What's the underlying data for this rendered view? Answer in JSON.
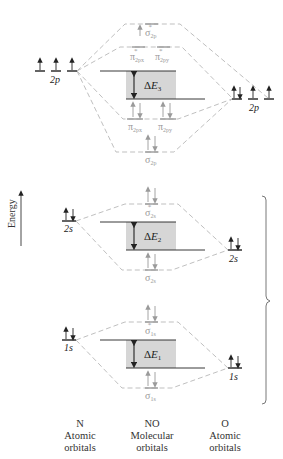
{
  "colors": {
    "line": "#222222",
    "faded": "#9a9a9a",
    "dash": "#b5b5b5",
    "gap_fill": "#d6d6d6"
  },
  "axis": {
    "label": "Energy",
    "direction": "up"
  },
  "columns": [
    {
      "id": "N",
      "line1": "N",
      "line2": "Atomic",
      "line3": "orbitals"
    },
    {
      "id": "NO",
      "line1": "NO",
      "line2": "Molecular",
      "line3": "orbitals"
    },
    {
      "id": "O",
      "line1": "O",
      "line2": "Atomic",
      "line3": "orbitals"
    }
  ],
  "atomic_orbitals": {
    "N_2p": {
      "label": "2p",
      "electrons": [
        "↑",
        "↑",
        "↑"
      ]
    },
    "O_2p": {
      "label": "2p",
      "electrons": [
        "↑↓",
        "↑",
        "↑"
      ]
    },
    "N_2s": {
      "label": "2s",
      "electrons": [
        "↑↓"
      ]
    },
    "O_2s": {
      "label": "2s",
      "electrons": [
        "↑↓"
      ]
    },
    "N_1s": {
      "label": "1s",
      "electrons": [
        "↑↓"
      ]
    },
    "O_1s": {
      "label": "1s",
      "electrons": [
        "↑↓"
      ]
    }
  },
  "molecular_orbitals": {
    "sigma_star_2p": {
      "label": "σ*2p",
      "sym": "σ",
      "sub": "2p",
      "star": "*",
      "electrons": "↑"
    },
    "pi_star_2px": {
      "label": "π*2px",
      "sym": "π",
      "sub": "2px",
      "star": "*",
      "electrons": ""
    },
    "pi_star_2py": {
      "label": "π*2py",
      "sym": "π",
      "sub": "2py",
      "star": "*",
      "electrons": ""
    },
    "pi_2px": {
      "label": "π2px",
      "sym": "π",
      "sub": "2px",
      "electrons": "↑↓"
    },
    "pi_2py": {
      "label": "π2py",
      "sym": "π",
      "sub": "2py",
      "electrons": "↑↓"
    },
    "sigma_2p": {
      "label": "σ2p",
      "sym": "σ",
      "sub": "2p",
      "electrons": "↑↓"
    },
    "sigma_star_2s": {
      "label": "σ*2s",
      "sym": "σ",
      "sub": "2s",
      "star": "*",
      "electrons": "↑↓"
    },
    "sigma_2s": {
      "label": "σ2s",
      "sym": "σ",
      "sub": "2s",
      "electrons": "↑↓"
    },
    "sigma_star_1s": {
      "label": "σ*1s",
      "sym": "σ",
      "sub": "1s",
      "star": "*",
      "electrons": "↑↓"
    },
    "sigma_1s": {
      "label": "σ1s",
      "sym": "σ",
      "sub": "1s",
      "electrons": "↑↓"
    }
  },
  "energy_gaps": [
    {
      "id": "dE3",
      "delta": "Δ",
      "E": "E",
      "sub": "3"
    },
    {
      "id": "dE2",
      "delta": "Δ",
      "E": "E",
      "sub": "2"
    },
    {
      "id": "dE1",
      "delta": "Δ",
      "E": "E",
      "sub": "1"
    }
  ]
}
